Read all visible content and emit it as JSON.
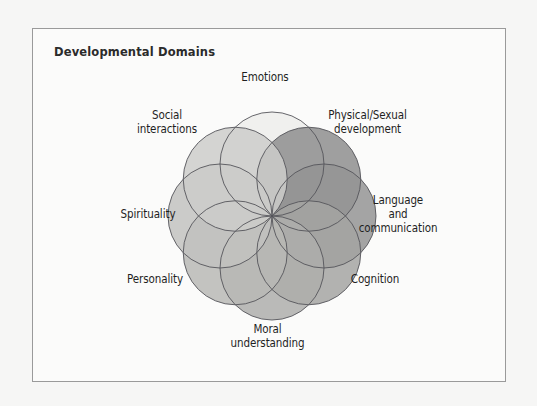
{
  "figure": {
    "title": "Developmental Domains",
    "frame_border_color": "#9a9a9a",
    "background_color": "#f6f6f5",
    "panel_color": "#fbfbfa",
    "stroke_color": "#55555a"
  },
  "chart_data": {
    "type": "venn",
    "title": "Developmental Domains",
    "center": {
      "x": 272,
      "y": 216
    },
    "circle_radius": 52,
    "center_offset": 52,
    "categories": [
      "Emotions",
      "Physical/Sexual development",
      "Language and communication",
      "Cognition",
      "Moral understanding",
      "Personality",
      "Spirituality",
      "Social interactions"
    ],
    "petals": [
      {
        "label": "Emotions",
        "label_lines": "Emotions",
        "angle_deg": -90,
        "fill": "#ededeb",
        "opacity": 0.85
      },
      {
        "label": "Physical/Sexual development",
        "label_lines": "Physical/Sexual\ndevelopment",
        "angle_deg": -45,
        "fill": "#8e8e8e",
        "opacity": 0.85
      },
      {
        "label": "Language and communication",
        "label_lines": "Language\nand\ncommunication",
        "angle_deg": 0,
        "fill": "#949494",
        "opacity": 0.85
      },
      {
        "label": "Cognition",
        "label_lines": "Cognition",
        "angle_deg": 45,
        "fill": "#a4a4a2",
        "opacity": 0.85
      },
      {
        "label": "Moral understanding",
        "label_lines": "Moral\nunderstanding",
        "angle_deg": 90,
        "fill": "#aeaeac",
        "opacity": 0.85
      },
      {
        "label": "Personality",
        "label_lines": "Personality",
        "angle_deg": 135,
        "fill": "#b8b8b5",
        "opacity": 0.85
      },
      {
        "label": "Spirituality",
        "label_lines": "Spirituality",
        "angle_deg": 180,
        "fill": "#c2c2bf",
        "opacity": 0.85
      },
      {
        "label": "Social interactions",
        "label_lines": "Social\ninteractions",
        "angle_deg": -135,
        "fill": "#cdcdca",
        "opacity": 0.85
      }
    ],
    "legend": "none",
    "grid": false
  },
  "labels": {
    "emotions": "Emotions",
    "physical": "Physical/Sexual\ndevelopment",
    "language": "Language\nand\ncommunication",
    "cognition": "Cognition",
    "moral": "Moral\nunderstanding",
    "personality": "Personality",
    "spirituality": "Spirituality",
    "social": "Social\ninteractions"
  }
}
